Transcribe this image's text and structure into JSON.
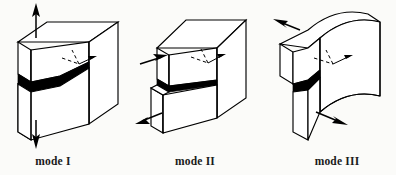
{
  "figure": {
    "background_color": "#fbfbf9",
    "ink_color": "#000000",
    "panel_count": 3
  },
  "panels": [
    {
      "id": "mode-1",
      "label": "mode I",
      "name": "Opening mode",
      "crack_fill": "#000000",
      "body_shape": "rectangular block split horizontally at mid-height",
      "crack_shape": "wide black V-shaped wedge opening through the block face",
      "axis_marker": "dashed crack-tip coordinate triad with arrow",
      "arrows": [
        {
          "id": "mode-1-arrow-up",
          "direction": "up",
          "position": "top of upper block",
          "meaning": "tensile pull"
        },
        {
          "id": "mode-1-arrow-down",
          "direction": "down",
          "position": "bottom of lower block",
          "meaning": "tensile pull"
        }
      ]
    },
    {
      "id": "mode-2",
      "label": "mode II",
      "name": "In-plane shear mode",
      "crack_fill": "#000000",
      "body_shape": "rectangular block with lower front segment offset by sliding",
      "crack_shape": "thin black sliding band along the crack plane",
      "axis_marker": "dashed crack-tip coordinate triad with arrow",
      "arrows": [
        {
          "id": "mode-2-arrow-right",
          "direction": "right",
          "position": "upper left face",
          "meaning": "in-plane shear"
        },
        {
          "id": "mode-2-arrow-left",
          "direction": "left",
          "position": "lower left face",
          "meaning": "in-plane shear"
        }
      ]
    },
    {
      "id": "mode-3",
      "label": "mode III",
      "name": "Out-of-plane tearing mode",
      "crack_fill": "#000000",
      "body_shape": "block with warped curved top and bottom surfaces",
      "crack_shape": "tapered black wedge at the crack front",
      "axis_marker": "dashed crack-tip coordinate triad with arrow",
      "arrows": [
        {
          "id": "mode-3-arrow-left",
          "direction": "left",
          "position": "top of block",
          "meaning": "anti-plane tear"
        },
        {
          "id": "mode-3-arrow-right",
          "direction": "right",
          "position": "bottom of block",
          "meaning": "anti-plane tear"
        }
      ]
    }
  ]
}
